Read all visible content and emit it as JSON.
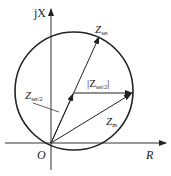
{
  "diagram": {
    "type": "impedance-circle",
    "axes": {
      "vertical_label": "jX",
      "horizontal_label": "R",
      "origin_label": "O"
    },
    "vectors": [
      {
        "name": "Z",
        "subscript": "set",
        "from": "O",
        "to": "top of circle"
      },
      {
        "name": "Z",
        "subscript": "set/2",
        "from": "O",
        "to": "circle center"
      },
      {
        "name": "|Z",
        "subscript": "set/2",
        "suffix": "|",
        "from": "circle center",
        "to": "right edge of circle"
      },
      {
        "name": "Z",
        "subscript": "m",
        "from": "O",
        "to": "right edge of circle"
      }
    ],
    "labels": {
      "zset_main": "Z",
      "zset_sub": "set",
      "zhalf_main": "Z",
      "zhalf_sub": "set/2",
      "radius_open": "|Z",
      "radius_sub": "set/2",
      "radius_close": "|",
      "zm_main": "Z",
      "zm_sub": "m"
    },
    "colors": {
      "stroke": "#222222",
      "background": "#ffffff"
    }
  }
}
